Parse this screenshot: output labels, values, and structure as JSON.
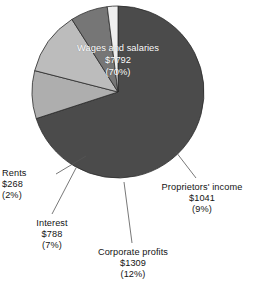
{
  "chart_data": {
    "type": "pie",
    "title": "",
    "unit": "billions of dollars",
    "total": 11198,
    "categories": [
      "Wages and salaries",
      "Proprietors' income",
      "Corporate profits",
      "Interest",
      "Rents"
    ],
    "values": [
      7792,
      1041,
      1309,
      788,
      268
    ],
    "percentages": [
      70,
      9,
      12,
      7,
      2
    ],
    "legend": "in-slice and external labels with leader lines",
    "slices": [
      {
        "label": "Wages and salaries",
        "value": "$7792",
        "percent": "(70%)",
        "pct_num": 70,
        "color": "#4b4b4b",
        "label_position": "inside",
        "text_color": "#ffffff"
      },
      {
        "label": "Proprietors' income",
        "value": "$1041",
        "percent": "(9%)",
        "pct_num": 9,
        "color": "#aeaeae",
        "label_position": "outside-right",
        "text_color": "#141414"
      },
      {
        "label": "Corporate profits",
        "value": "$1309",
        "percent": "(12%)",
        "pct_num": 12,
        "color": "#bcbcbc",
        "label_position": "outside-bottom",
        "text_color": "#141414"
      },
      {
        "label": "Interest",
        "value": "$788",
        "percent": "(7%)",
        "pct_num": 7,
        "color": "#767676",
        "label_position": "outside-bottom-left",
        "text_color": "#141414"
      },
      {
        "label": "Rents",
        "value": "$268",
        "percent": "(2%)",
        "pct_num": 2,
        "color": "#efefef",
        "label_position": "outside-left",
        "text_color": "#141414"
      }
    ]
  },
  "labels": {
    "wages": {
      "name": "Wages and salaries",
      "value": "$7792",
      "percent": "(70%)"
    },
    "proprietor": {
      "name": "Proprietors' income",
      "value": "$1041",
      "percent": "(9%)"
    },
    "corporate": {
      "name": "Corporate profits",
      "value": "$1309",
      "percent": "(12%)"
    },
    "interest": {
      "name": "Interest",
      "value": "$788",
      "percent": "(7%)"
    },
    "rents": {
      "name": "Rents",
      "value": "$268",
      "percent": "(2%)"
    }
  },
  "colors": {
    "wages": "#4b4b4b",
    "proprietor": "#aeaeae",
    "corporate": "#bcbcbc",
    "interest": "#767676",
    "rents": "#efefef",
    "outline": "#2b2b2b",
    "leader": "#555555",
    "background": "#ffffff"
  }
}
